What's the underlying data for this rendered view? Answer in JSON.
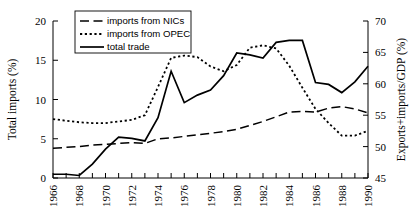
{
  "chart_data": {
    "type": "line",
    "title": "",
    "xlabel": "",
    "ylabel": "Total imports (%)",
    "y2label": "Exports+imports/GDP (%)",
    "grid": false,
    "legend_position": "top-center",
    "x": [
      1966,
      1967,
      1968,
      1969,
      1970,
      1971,
      1972,
      1973,
      1974,
      1975,
      1976,
      1977,
      1978,
      1979,
      1980,
      1981,
      1982,
      1983,
      1984,
      1985,
      1986,
      1987,
      1988,
      1989,
      1990
    ],
    "xlim": [
      1966,
      1990
    ],
    "xticklabels": [
      "1966",
      "1968",
      "1970",
      "1972",
      "1974",
      "1976",
      "1978",
      "1980",
      "1982",
      "1984",
      "1986",
      "1988",
      "1990"
    ],
    "xtick_values": [
      1966,
      1968,
      1970,
      1972,
      1974,
      1976,
      1978,
      1980,
      1982,
      1984,
      1986,
      1988,
      1990
    ],
    "ylim": [
      0,
      20
    ],
    "yticks": [
      0,
      5,
      10,
      15,
      20
    ],
    "yticklabels": [
      "0",
      "5",
      "10",
      "15",
      "20"
    ],
    "y2lim": [
      45,
      70
    ],
    "y2ticks": [
      45,
      50,
      55,
      60,
      65,
      70
    ],
    "y2ticklabels": [
      "45",
      "50",
      "55",
      "60",
      "65",
      "70"
    ],
    "series": [
      {
        "name": "imports from NICs",
        "axis": "left",
        "style": "dashed",
        "values": [
          3.8,
          3.9,
          4.0,
          4.2,
          4.3,
          4.4,
          4.5,
          4.4,
          5.0,
          5.1,
          5.3,
          5.5,
          5.7,
          5.9,
          6.2,
          6.7,
          7.2,
          7.8,
          8.4,
          8.5,
          8.4,
          8.9,
          9.1,
          8.8,
          8.3
        ]
      },
      {
        "name": "imports from OPEC",
        "axis": "left",
        "style": "dotted",
        "values": [
          7.5,
          7.3,
          7.1,
          7.0,
          7.0,
          7.2,
          7.4,
          8.0,
          11.6,
          15.3,
          15.6,
          15.4,
          14.2,
          13.6,
          14.4,
          16.6,
          16.9,
          16.5,
          14.3,
          11.5,
          8.8,
          7.0,
          5.4,
          5.4,
          6.0
        ]
      },
      {
        "name": "total trade",
        "axis": "right",
        "style": "solid",
        "values": [
          45.6,
          45.6,
          45.4,
          47.2,
          49.6,
          51.5,
          51.3,
          50.9,
          54.6,
          62.0,
          57.0,
          58.2,
          59.0,
          61.3,
          64.9,
          64.6,
          64.1,
          66.6,
          66.9,
          66.9,
          60.2,
          59.9,
          58.6,
          60.3,
          62.8
        ]
      }
    ],
    "legend": [
      {
        "label": "imports from NICs",
        "style": "dashed"
      },
      {
        "label": "imports from OPEC",
        "style": "dotted"
      },
      {
        "label": "total trade",
        "style": "solid"
      }
    ]
  }
}
